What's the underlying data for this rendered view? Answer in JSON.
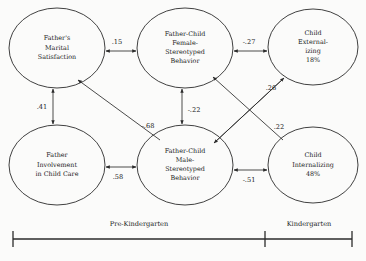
{
  "diagram": {
    "type": "path-diagram",
    "nodes": [
      {
        "id": "fathers-marital-satisfaction",
        "lines": [
          "Father's",
          "Marital",
          "Satisfaction"
        ],
        "cx": 57,
        "cy": 48,
        "rx": 48,
        "ry": 40
      },
      {
        "id": "father-child-female-stereotyped-behavior",
        "lines": [
          "Father-Child",
          "Female-",
          "Stereotyped",
          "Behavior"
        ],
        "cx": 185,
        "cy": 48,
        "rx": 48,
        "ry": 40
      },
      {
        "id": "child-externalizing",
        "lines": [
          "Child",
          "External-",
          "izing",
          "18%"
        ],
        "cx": 313,
        "cy": 47,
        "rx": 45,
        "ry": 38
      },
      {
        "id": "father-involvement-in-child-care",
        "lines": [
          "Father",
          "Involvement",
          "in Child Care"
        ],
        "cx": 57,
        "cy": 165,
        "rx": 48,
        "ry": 40
      },
      {
        "id": "father-child-male-stereotyped-behavior",
        "lines": [
          "Father-Child",
          "Male-",
          "Stereotyped",
          "Behavior"
        ],
        "cx": 185,
        "cy": 165,
        "rx": 48,
        "ry": 40
      },
      {
        "id": "child-internalizing",
        "lines": [
          "Child",
          "Internalizing",
          "48%"
        ],
        "cx": 313,
        "cy": 165,
        "rx": 45,
        "ry": 38
      }
    ],
    "edges": [
      {
        "id": "marital-to-female-stereotyped",
        "from": "fathers-marital-satisfaction",
        "to": "father-child-female-stereotyped-behavior",
        "coefficient": ".15",
        "arrows": "both",
        "x1": 106,
        "y1": 51,
        "x2": 136,
        "y2": 51,
        "lx": 117,
        "ly": 42
      },
      {
        "id": "externalizing-to-female-stereotyped",
        "from": "child-externalizing",
        "to": "father-child-female-stereotyped-behavior",
        "coefficient": "-.27",
        "arrows": "both",
        "x1": 267,
        "y1": 51,
        "x2": 234,
        "y2": 51,
        "lx": 249,
        "ly": 42
      },
      {
        "id": "marital-to-involvement",
        "from": "fathers-marital-satisfaction",
        "to": "father-involvement-in-child-care",
        "coefficient": ".41",
        "arrows": "both",
        "x1": 53,
        "y1": 89,
        "x2": 53,
        "y2": 124,
        "lx": 42,
        "ly": 107
      },
      {
        "id": "female-stereotyped-to-male-stereotyped",
        "from": "father-child-female-stereotyped-behavior",
        "to": "father-child-male-stereotyped-behavior",
        "coefficient": "-.22",
        "arrows": "both",
        "x1": 182,
        "y1": 89,
        "x2": 182,
        "y2": 124,
        "lx": 194,
        "ly": 110
      },
      {
        "id": "involvement-to-male-stereotyped",
        "from": "father-involvement-in-child-care",
        "to": "father-child-male-stereotyped-behavior",
        "coefficient": ".58",
        "arrows": "both",
        "x1": 106,
        "y1": 167,
        "x2": 136,
        "y2": 167,
        "lx": 118,
        "ly": 177
      },
      {
        "id": "male-stereotyped-to-internalizing",
        "from": "father-child-male-stereotyped-behavior",
        "to": "child-internalizing",
        "coefficient": "-.51",
        "arrows": "both",
        "x1": 234,
        "y1": 170,
        "x2": 267,
        "y2": 170,
        "lx": 249,
        "ly": 180
      },
      {
        "id": "male-stereotyped-to-marital",
        "from": "father-child-male-stereotyped-behavior",
        "to": "fathers-marital-satisfaction",
        "coefficient": "-.68",
        "arrows": "end",
        "x1": 160,
        "y1": 140,
        "x2": 78,
        "y2": 80,
        "lx": 148,
        "ly": 126
      },
      {
        "id": "male-stereotyped-to-externalizing",
        "from": "father-child-male-stereotyped-behavior",
        "to": "child-externalizing",
        "coefficient": ".26",
        "arrows": "end",
        "x1": 214,
        "y1": 143,
        "x2": 284,
        "y2": 78,
        "lx": 271,
        "ly": 88
      },
      {
        "id": "internalizing-to-female-stereotyped",
        "from": "child-internalizing",
        "to": "father-child-female-stereotyped-behavior",
        "coefficient": ".22",
        "arrows": "end",
        "x1": 283,
        "y1": 140,
        "x2": 213,
        "y2": 77,
        "lx": 279,
        "ly": 127
      },
      {
        "id": "internalizing-to-male-stereotyped",
        "from": "child-internalizing",
        "to": "father-child-male-stereotyped-behavior",
        "coefficient": "",
        "arrows": "end",
        "x1": 284,
        "y1": 78,
        "x2": 214,
        "y2": 143,
        "lx": 0,
        "ly": 0
      }
    ],
    "timeline": {
      "y": 239,
      "x_start": 13,
      "x_divider": 265,
      "x_end": 352,
      "segments": [
        {
          "id": "pre-kindergarten",
          "label": "Pre-Kindergarten",
          "lx": 139,
          "ly": 224
        },
        {
          "id": "kindergarten",
          "label": "Kindergarten",
          "lx": 309,
          "ly": 224
        }
      ]
    }
  }
}
